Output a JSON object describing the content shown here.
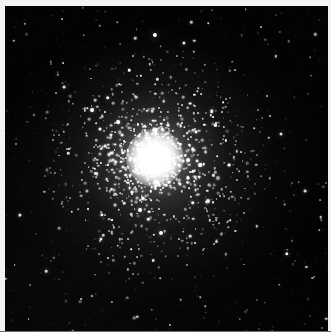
{
  "image": {
    "kind": "astronomical-photograph",
    "subject": "globular star cluster",
    "title": "Globular cluster",
    "alt_text": "Black-and-white astronomical photograph of a globular star cluster: a dense, round swarm of thousands of stars with a saturated white unresolved core, surrounded by a halo of individually resolved stars that thins gradually into a sparse black star field.",
    "width_px": 331,
    "height_px": 332,
    "orientation": "square",
    "color_mode": "grayscale"
  },
  "frame": {
    "border_label": "photographic print margin",
    "border_color": "#f4f3f1",
    "bottom_rule_color": "#6e6c68",
    "sky_color": "#030303",
    "sky_left_px": 5,
    "sky_top_px": 6,
    "sky_width_px": 323,
    "sky_height_px": 326
  },
  "cluster": {
    "label": "globular cluster",
    "center_x_px": 155,
    "center_y_px": 158,
    "core_label": "saturated unresolved core",
    "core_color": "#ffffff",
    "core_radius_px": 20,
    "inner_halo_radius_px": 48,
    "outer_halo_radius_px": 112,
    "star_color": "#ffffff",
    "resolved_star_count": 1400,
    "field_star_count": 240,
    "glow_layers": [
      {
        "name": "outer-glow",
        "radius_px": 118,
        "opacity": 0.1
      },
      {
        "name": "mid-glow",
        "radius_px": 72,
        "opacity": 0.16
      },
      {
        "name": "inner-glow",
        "radius_px": 42,
        "opacity": 0.3
      },
      {
        "name": "core-glow",
        "radius_px": 26,
        "opacity": 0.62
      }
    ]
  },
  "bright_stars": [
    {
      "name": "bright-field-star-north",
      "x_px": 155,
      "y_px": 35,
      "size_px": 4.2,
      "brightness": 1.0
    },
    {
      "name": "bright-field-star-northeast",
      "x_px": 184,
      "y_px": 43,
      "size_px": 3.2,
      "brightness": 0.92
    },
    {
      "name": "bright-field-star-east",
      "x_px": 281,
      "y_px": 134,
      "size_px": 3.0,
      "brightness": 0.88
    },
    {
      "name": "bright-field-star-southeast",
      "x_px": 287,
      "y_px": 254,
      "size_px": 3.4,
      "brightness": 0.95
    },
    {
      "name": "bright-field-star-south",
      "x_px": 161,
      "y_px": 233,
      "size_px": 4.0,
      "brightness": 1.0
    },
    {
      "name": "bright-field-star-southwest",
      "x_px": 101,
      "y_px": 239,
      "size_px": 3.2,
      "brightness": 0.9
    },
    {
      "name": "bright-field-star-west",
      "x_px": 20,
      "y_px": 215,
      "size_px": 3.2,
      "brightness": 0.9
    },
    {
      "name": "bright-field-star-northwest",
      "x_px": 64,
      "y_px": 87,
      "size_px": 2.8,
      "brightness": 0.85
    },
    {
      "name": "bright-field-star-far-east",
      "x_px": 305,
      "y_px": 191,
      "size_px": 2.8,
      "brightness": 0.82
    },
    {
      "name": "bright-field-star-lower-left",
      "x_px": 46,
      "y_px": 271,
      "size_px": 2.6,
      "brightness": 0.8
    }
  ]
}
